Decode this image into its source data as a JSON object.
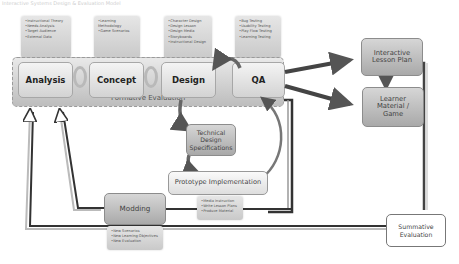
{
  "caption": "Interactive Systems Design & Evaluation Model",
  "notes": {
    "analysis": [
      "Instructional Theory",
      "Needs Analysis",
      "Target Audience",
      "External Data"
    ],
    "concept": [
      "Learning Methodology",
      "Game Scenarios"
    ],
    "design": [
      "Character Design",
      "Design Lesson",
      "Design Media",
      "Storyboards",
      "Instructional Design"
    ],
    "qa": [
      "Bug Testing",
      "Usability Testing",
      "Play Flow Testing",
      "Learning Testing"
    ],
    "prototype": [
      "Media Instruction",
      "Write Lesson Plans",
      "Produce Material"
    ],
    "modding": [
      "New Scenarios",
      "New Learning Objectives",
      "New Evaluation"
    ]
  },
  "stages": {
    "analysis": "Analysis",
    "concept": "Concept",
    "design": "Design",
    "qa": "QA"
  },
  "formative_label": "Formative Evaluation",
  "boxes": {
    "technical_design": "Technical Design Specifications",
    "prototype": "Prototype Implementation",
    "modding": "Modding",
    "lesson_plan": "Interactive Lesson Plan",
    "learner_material": "Learner Material / Game",
    "summative": "Summative Evaluation"
  }
}
